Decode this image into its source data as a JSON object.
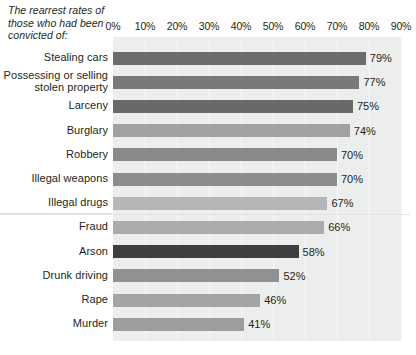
{
  "chart_data": {
    "type": "bar",
    "orientation": "horizontal",
    "title": "The rearrest rates of those who had been convicted of:",
    "xlabel": "",
    "ylabel": "",
    "xlim": [
      0,
      90
    ],
    "grid": true,
    "legend": "none",
    "tick_labels": [
      "0%",
      "10%",
      "20%",
      "30%",
      "40%",
      "50%",
      "60%",
      "70%",
      "80%",
      "90%"
    ],
    "tick_values": [
      0,
      10,
      20,
      30,
      40,
      50,
      60,
      70,
      80,
      90
    ],
    "categories": [
      "Stealing cars",
      "Possessing or selling stolen property",
      "Larceny",
      "Burglary",
      "Robbery",
      "Illegal weapons",
      "Illegal drugs",
      "Fraud",
      "Arson",
      "Drunk driving",
      "Rape",
      "Murder"
    ],
    "values": [
      79,
      77,
      75,
      74,
      70,
      70,
      67,
      66,
      58,
      52,
      46,
      41
    ],
    "value_labels": [
      "79%",
      "77%",
      "75%",
      "74%",
      "70%",
      "70%",
      "67%",
      "66%",
      "58%",
      "52%",
      "46%",
      "41%"
    ],
    "bar_colors": [
      "#6b6c6e",
      "#77797b",
      "#68696b",
      "#9fa1a3",
      "#88898b",
      "#8a8c8e",
      "#b4b6b7",
      "#a9abac",
      "#3d3e40",
      "#8f9193",
      "#a2a4a5",
      "#9b9d9f"
    ],
    "plot_background": "#eceded",
    "gridline_color": "#f7f8f8",
    "text_color": "#231f20"
  }
}
